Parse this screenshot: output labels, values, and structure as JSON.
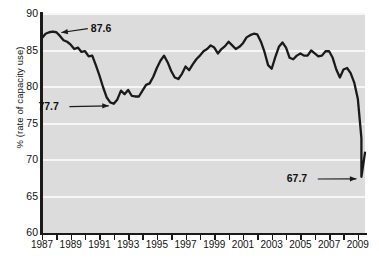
{
  "chart_data": {
    "type": "line",
    "title": "",
    "xlabel": "",
    "ylabel": "% (rate of capacity use)",
    "xlim": [
      1987,
      2009.5
    ],
    "ylim": [
      60,
      90
    ],
    "grid": true,
    "legend": "none",
    "ytick_labels": [
      "60",
      "65",
      "70",
      "75",
      "80",
      "85",
      "90"
    ],
    "ytick_values": [
      60,
      65,
      70,
      75,
      80,
      85,
      90
    ],
    "xtick_labels": [
      "1987",
      "1989",
      "1991",
      "1993",
      "1995",
      "1997",
      "1999",
      "2001",
      "2003",
      "2005",
      "2007",
      "2009"
    ],
    "xtick_values": [
      1987,
      1989,
      1991,
      1993,
      1995,
      1997,
      1999,
      2001,
      2003,
      2005,
      2007,
      2009
    ],
    "xminor_ticks": [
      1987,
      1988,
      1989,
      1990,
      1991,
      1992,
      1993,
      1994,
      1995,
      1996,
      1997,
      1998,
      1999,
      2000,
      2001,
      2002,
      2003,
      2004,
      2005,
      2006,
      2007,
      2008,
      2009
    ],
    "line_color": "#1a1a1a",
    "plot_background": "#dcdcdc",
    "gridline_color": "#f6f6f6",
    "series": [
      {
        "name": "Capacity utilization rate",
        "x": [
          1987.0,
          1987.25,
          1987.5,
          1987.75,
          1988.0,
          1988.25,
          1988.5,
          1988.75,
          1989.0,
          1989.25,
          1989.5,
          1989.75,
          1990.0,
          1990.25,
          1990.5,
          1990.75,
          1991.0,
          1991.25,
          1991.5,
          1991.75,
          1992.0,
          1992.25,
          1992.5,
          1992.75,
          1993.0,
          1993.25,
          1993.5,
          1993.75,
          1994.0,
          1994.25,
          1994.5,
          1994.75,
          1995.0,
          1995.25,
          1995.5,
          1995.75,
          1996.0,
          1996.25,
          1996.5,
          1996.75,
          1997.0,
          1997.25,
          1997.5,
          1997.75,
          1998.0,
          1998.25,
          1998.5,
          1998.75,
          1999.0,
          1999.25,
          1999.5,
          1999.75,
          2000.0,
          2000.25,
          2000.5,
          2000.75,
          2001.0,
          2001.25,
          2001.5,
          2001.75,
          2002.0,
          2002.25,
          2002.5,
          2002.75,
          2003.0,
          2003.25,
          2003.5,
          2003.75,
          2004.0,
          2004.25,
          2004.5,
          2004.75,
          2005.0,
          2005.25,
          2005.5,
          2005.75,
          2006.0,
          2006.25,
          2006.5,
          2006.75,
          2007.0,
          2007.25,
          2007.5,
          2007.75,
          2008.0,
          2008.25,
          2008.5,
          2008.75,
          2009.0,
          2009.25
        ],
        "y": [
          86.7,
          87.3,
          87.5,
          87.6,
          87.5,
          87.0,
          86.4,
          86.2,
          85.8,
          85.2,
          85.4,
          84.8,
          84.9,
          84.2,
          84.3,
          83.0,
          81.6,
          80.0,
          78.6,
          77.9,
          77.7,
          78.3,
          79.5,
          79.0,
          79.6,
          78.8,
          78.7,
          78.7,
          79.5,
          80.3,
          80.5,
          81.4,
          82.6,
          83.6,
          84.3,
          83.4,
          82.2,
          81.3,
          81.1,
          81.8,
          82.8,
          82.3,
          83.1,
          83.8,
          84.3,
          84.9,
          85.2,
          85.7,
          85.4,
          84.6,
          85.2,
          85.6,
          86.2,
          85.7,
          85.2,
          85.5,
          86.0,
          86.8,
          87.1,
          87.3,
          87.2,
          86.2,
          84.8,
          83.0,
          82.5,
          84.1,
          85.5,
          86.1,
          85.4,
          84.0,
          83.8,
          84.3,
          84.6,
          84.3,
          84.3,
          85.0,
          84.6,
          84.2,
          84.3,
          84.9,
          84.9,
          84.0,
          82.4,
          81.3,
          82.4,
          82.6,
          81.9,
          80.6,
          78.4,
          73.0
        ],
        "note": "Quarterly capacity utilization; final segment drops to 67.7 trough in mid-2009 then rebounds to about 71."
      }
    ],
    "annotations": [
      {
        "label": "87.6",
        "value": 87.6,
        "at_x": 1988.0,
        "arrow": "left",
        "text_x": 1990.4,
        "text_y": 88.0
      },
      {
        "label": "77.7",
        "value": 77.7,
        "at_x": 1992.0,
        "arrow": "right",
        "text_x": 1988.7,
        "text_y": 77.3
      },
      {
        "label": "67.7",
        "value": 67.7,
        "at_x": 2009.25,
        "arrow": "right",
        "text_x": 2006.0,
        "text_y": 67.4
      }
    ]
  }
}
